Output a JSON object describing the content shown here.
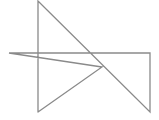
{
  "diagram": {
    "background": "#ffffff",
    "stroke_color": "#8a8a8a",
    "stroke_width": 1.3,
    "shape": "self-intersecting-polyline",
    "points": "38,112 38,1 150,112 150,53 9,53 102,67 38,112",
    "vertices": [
      {
        "x": 38,
        "y": 112
      },
      {
        "x": 38,
        "y": 1
      },
      {
        "x": 150,
        "y": 112
      },
      {
        "x": 150,
        "y": 53
      },
      {
        "x": 9,
        "y": 53
      },
      {
        "x": 102,
        "y": 67
      },
      {
        "x": 38,
        "y": 112
      }
    ]
  }
}
